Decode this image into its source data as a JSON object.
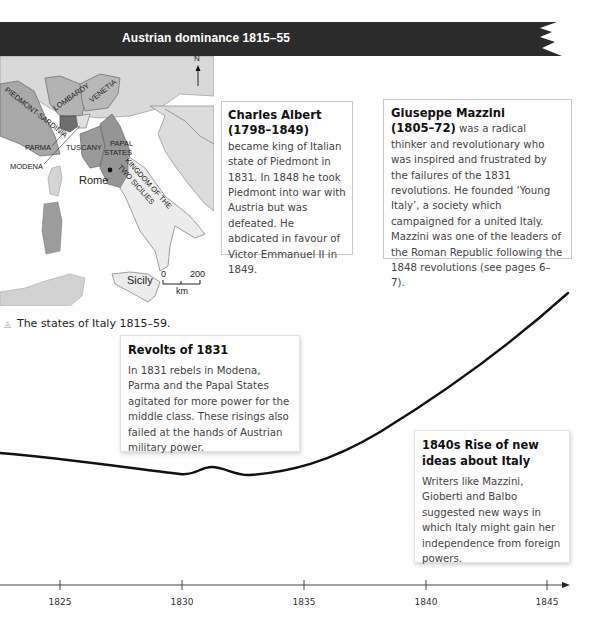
{
  "banner": {
    "title": "Austrian dominance 1815–55",
    "background": "#2b2b2b",
    "text_color": "#ffffff"
  },
  "map": {
    "compass": "N",
    "regions": {
      "piedmont": "PIEDMONT-SARDINIA",
      "lombardy": "LOMBARDY",
      "venetia": "VENETIA",
      "parma": "PARMA",
      "modena": "MODENA",
      "tuscany": "TUSCANY",
      "papal_states_1": "PAPAL",
      "papal_states_2": "STATES",
      "two_sicilies": "KINGDOM OF THE TWO SICILIES",
      "rome": "Rome",
      "sicily": "Sicily"
    },
    "scale": {
      "start": "0",
      "end": "200",
      "unit": "km"
    },
    "caption": "The states of Italy 1815–59."
  },
  "boxes": {
    "charles_albert": {
      "name": "Charles Albert (1798–1849)",
      "name_line1": "Charles Albert",
      "name_line2": "(1798–1849)",
      "text_after": " became king of Italian state of Piedmont in 1831. In 1848 he took Piedmont into war with Austria but was defeated. He abdicated in favour of Victor Emmanuel II in 1849."
    },
    "mazzini": {
      "name_line1": "Giuseppe Mazzini",
      "name_line2": "(1805–72)",
      "text_after": " was a radical thinker and revolutionary who was inspired and frustrated by the failures of the 1831 revolutions. He founded ‘Young Italy’, a society which campaigned for a united Italy. Mazzini was one of the leaders of the Roman Republic following the 1848 revolutions (see pages 6–7)."
    },
    "revolts": {
      "title": "Revolts of 1831",
      "text": "In 1831 rebels in Modena, Parma and the Papal States agitated for more power for the middle class. These risings also failed at the hands of Austrian military power."
    },
    "ideas": {
      "title": "1840s Rise of new ideas about Italy",
      "text": "Writers like Mazzini, Gioberti and Balbo suggested new ways in which Italy might gain her independence from foreign powers."
    }
  },
  "timeline": {
    "ticks": [
      {
        "label": "1825",
        "x": 60
      },
      {
        "label": "1830",
        "x": 182
      },
      {
        "label": "1835",
        "x": 304
      },
      {
        "label": "1840",
        "x": 426
      },
      {
        "label": "1845",
        "x": 547
      }
    ]
  }
}
